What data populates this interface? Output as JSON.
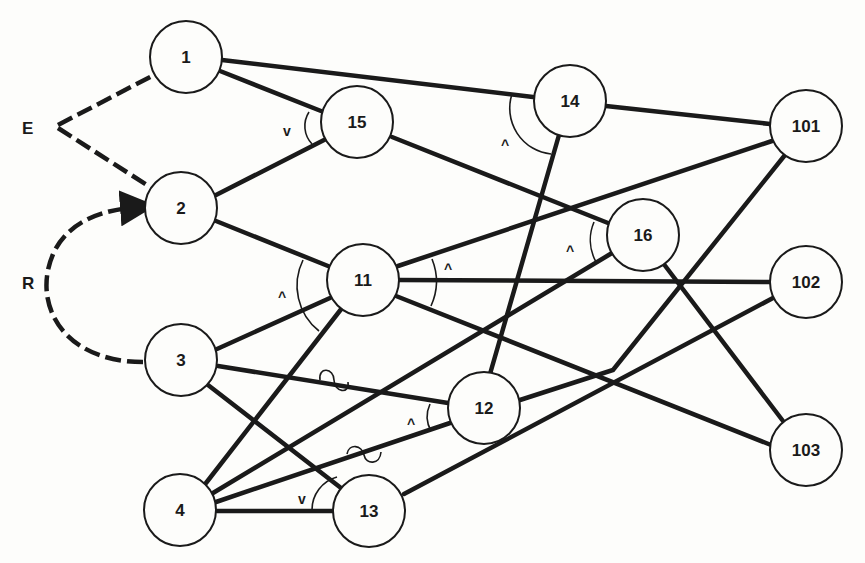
{
  "diagram": {
    "inputs": [
      {
        "id": "E",
        "label": "E",
        "x": 30,
        "y": 128
      },
      {
        "id": "R",
        "label": "R",
        "x": 30,
        "y": 283
      }
    ],
    "nodes": [
      {
        "id": "1",
        "label": "1",
        "x": 186,
        "y": 57
      },
      {
        "id": "2",
        "label": "2",
        "x": 181,
        "y": 208
      },
      {
        "id": "3",
        "label": "3",
        "x": 181,
        "y": 360
      },
      {
        "id": "4",
        "label": "4",
        "x": 180,
        "y": 510
      },
      {
        "id": "15",
        "label": "15",
        "x": 357,
        "y": 122
      },
      {
        "id": "14",
        "label": "14",
        "x": 570,
        "y": 101
      },
      {
        "id": "11",
        "label": "11",
        "x": 363,
        "y": 280
      },
      {
        "id": "16",
        "label": "16",
        "x": 643,
        "y": 235
      },
      {
        "id": "12",
        "label": "12",
        "x": 484,
        "y": 408
      },
      {
        "id": "13",
        "label": "13",
        "x": 369,
        "y": 511
      },
      {
        "id": "101",
        "label": "101",
        "x": 806,
        "y": 126
      },
      {
        "id": "102",
        "label": "102",
        "x": 806,
        "y": 282
      },
      {
        "id": "103",
        "label": "103",
        "x": 806,
        "y": 450
      }
    ],
    "edges": [
      {
        "from": "E",
        "to": "1",
        "style": "dashed"
      },
      {
        "from": "E",
        "to": "2",
        "style": "dashed"
      },
      {
        "from": "3",
        "to": "2",
        "style": "dashed-curved-arrow",
        "label": "R"
      },
      {
        "from": "1",
        "to": "14"
      },
      {
        "from": "1",
        "to": "15"
      },
      {
        "from": "2",
        "to": "15"
      },
      {
        "from": "2",
        "to": "11"
      },
      {
        "from": "15",
        "to": "16"
      },
      {
        "from": "3",
        "to": "11"
      },
      {
        "from": "3",
        "to": "12",
        "marker": "squiggle"
      },
      {
        "from": "3",
        "to": "13"
      },
      {
        "from": "4",
        "to": "11"
      },
      {
        "from": "4",
        "to": "16"
      },
      {
        "from": "4",
        "to": "12",
        "marker": "squiggle"
      },
      {
        "from": "4",
        "to": "13"
      },
      {
        "from": "14",
        "to": "12"
      },
      {
        "from": "14",
        "to": "101"
      },
      {
        "from": "11",
        "to": "101"
      },
      {
        "from": "11",
        "to": "102"
      },
      {
        "from": "11",
        "to": "103"
      },
      {
        "from": "12",
        "to": "101"
      },
      {
        "from": "13",
        "to": "102"
      },
      {
        "from": "16",
        "to": "103"
      }
    ],
    "operators": [
      {
        "node": "15",
        "symbol": "v",
        "x": 287,
        "y": 132
      },
      {
        "node": "14",
        "symbol": "^",
        "x": 506,
        "y": 146
      },
      {
        "node": "11",
        "symbol": "^",
        "x": 283,
        "y": 298
      },
      {
        "node": "11",
        "symbol": "^",
        "x": 449,
        "y": 270
      },
      {
        "node": "16",
        "symbol": "^",
        "x": 571,
        "y": 252
      },
      {
        "node": "12",
        "symbol": "^",
        "x": 412,
        "y": 425
      },
      {
        "node": "13",
        "symbol": "v",
        "x": 302,
        "y": 500
      }
    ]
  }
}
